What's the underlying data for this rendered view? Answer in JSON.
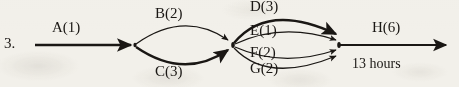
{
  "diagram": {
    "kind": "activity-on-arrow-network",
    "item_number": "3.",
    "total_duration_label": "13 hours",
    "ink_color": "#1a1714",
    "paper_color": "#f2f0ea",
    "activities": [
      {
        "id": "A",
        "label": "A(1)",
        "duration": 1,
        "from_node": "start",
        "to_node": "n1",
        "shape": "straight",
        "weight": "thick"
      },
      {
        "id": "B",
        "label": "B(2)",
        "duration": 2,
        "from_node": "n1",
        "to_node": "n2",
        "shape": "arc-up",
        "weight": "thin"
      },
      {
        "id": "C",
        "label": "C(3)",
        "duration": 3,
        "from_node": "n1",
        "to_node": "n2",
        "shape": "arc-down",
        "weight": "thick"
      },
      {
        "id": "D",
        "label": "D(3)",
        "duration": 3,
        "from_node": "n2",
        "to_node": "n3",
        "shape": "arc-up-far",
        "weight": "thick"
      },
      {
        "id": "E",
        "label": "E(1)",
        "duration": 1,
        "from_node": "n2",
        "to_node": "n3",
        "shape": "arc-up-near",
        "weight": "thin"
      },
      {
        "id": "F",
        "label": "F(2)",
        "duration": 2,
        "from_node": "n2",
        "to_node": "n3",
        "shape": "arc-down-near",
        "weight": "thin"
      },
      {
        "id": "G",
        "label": "G(2)",
        "duration": 2,
        "from_node": "n2",
        "to_node": "n3",
        "shape": "arc-down-far",
        "weight": "thin"
      },
      {
        "id": "H",
        "label": "H(6)",
        "duration": 6,
        "from_node": "n3",
        "to_node": "end",
        "shape": "straight",
        "weight": "thick"
      }
    ],
    "nodes": [
      {
        "id": "start",
        "x": 35,
        "y": 45
      },
      {
        "id": "n1",
        "x": 135,
        "y": 45
      },
      {
        "id": "n2",
        "x": 232,
        "y": 45
      },
      {
        "id": "n3",
        "x": 340,
        "y": 45
      },
      {
        "id": "end",
        "x": 450,
        "y": 45
      }
    ]
  }
}
